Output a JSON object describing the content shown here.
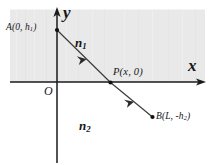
{
  "figure": {
    "type": "physics-optics-refraction-diagram",
    "background_color": "#ffffff",
    "shaded_region_color": "#e8e8e8",
    "line_color": "#1a1a1a",
    "axes": {
      "x_axis_label": "x",
      "y_axis_label": "y",
      "origin_label": "O"
    },
    "media": {
      "upper": "n",
      "upper_index": "1",
      "lower": "n",
      "lower_index": "2"
    },
    "points": {
      "A": {
        "name": "A",
        "label_prefix": "A(0, ",
        "label_symbol": "h",
        "label_subscript": "1",
        "label_suffix": ")",
        "x": 0,
        "y": "h1"
      },
      "P": {
        "name": "P",
        "label": "P(x, 0)",
        "x": "x",
        "y": 0
      },
      "B": {
        "name": "B",
        "label_prefix": "B(L, -",
        "label_symbol": "h",
        "label_subscript": "2",
        "label_suffix": ")",
        "x": "L",
        "y": "-h2"
      }
    },
    "rays": [
      {
        "name": "incident-ray",
        "from": "A",
        "to": "P",
        "medium": "n1",
        "direction": "downward-right"
      },
      {
        "name": "refracted-ray",
        "from": "P",
        "to": "B",
        "medium": "n2",
        "direction": "downward-right"
      }
    ]
  }
}
